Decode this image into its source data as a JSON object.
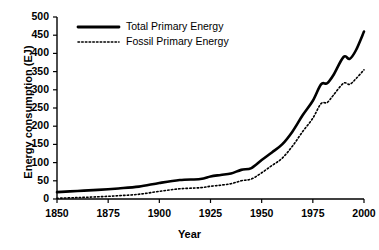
{
  "chart_data": {
    "type": "line",
    "title": "",
    "xlabel": "Year",
    "ylabel": "Energy consumption (EJ)",
    "xlim": [
      1850,
      2000
    ],
    "ylim": [
      0,
      500
    ],
    "xticks": [
      1850,
      1875,
      1900,
      1925,
      1950,
      1975,
      2000
    ],
    "yticks": [
      0,
      50,
      100,
      150,
      200,
      250,
      300,
      350,
      400,
      450,
      500
    ],
    "grid": false,
    "legend_position": "top-left-inside",
    "series": [
      {
        "name": "Total Primary Energy",
        "style": "solid",
        "color": "#000000",
        "linewidth": 2.6,
        "x": [
          1850,
          1860,
          1870,
          1880,
          1890,
          1900,
          1910,
          1920,
          1925,
          1930,
          1935,
          1940,
          1945,
          1950,
          1955,
          1960,
          1965,
          1970,
          1975,
          1979,
          1982,
          1985,
          1990,
          1993,
          1996,
          2000
        ],
        "values": [
          19,
          22,
          25,
          29,
          34,
          44,
          52,
          55,
          62,
          66,
          70,
          80,
          85,
          107,
          128,
          150,
          185,
          230,
          270,
          315,
          318,
          340,
          390,
          385,
          408,
          460
        ]
      },
      {
        "name": "Fossil Primary Energy",
        "style": "dotted",
        "color": "#000000",
        "linewidth": 1.6,
        "x": [
          1850,
          1860,
          1870,
          1880,
          1890,
          1900,
          1910,
          1920,
          1925,
          1930,
          1935,
          1940,
          1945,
          1950,
          1955,
          1960,
          1965,
          1970,
          1975,
          1979,
          1982,
          1985,
          1990,
          1993,
          1996,
          2000
        ],
        "values": [
          2,
          4,
          6,
          9,
          13,
          21,
          28,
          31,
          35,
          38,
          42,
          50,
          55,
          72,
          92,
          112,
          145,
          185,
          222,
          262,
          265,
          285,
          318,
          315,
          330,
          355
        ]
      }
    ],
    "legend": [
      {
        "label": "Total Primary Energy",
        "style": "solid"
      },
      {
        "label": "Fossil Primary Energy",
        "style": "dotted"
      }
    ]
  }
}
